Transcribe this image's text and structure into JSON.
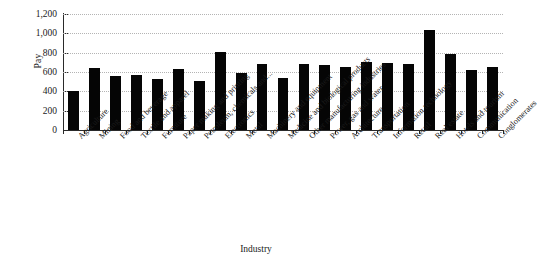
{
  "chart_data": {
    "type": "bar",
    "title": "",
    "xlabel": "Industry",
    "ylabel": "Pay",
    "ylim": [
      0,
      1200
    ],
    "ytick_step": 200,
    "ytick_labels": [
      "1,200",
      "1,000",
      "800",
      "600",
      "400",
      "200",
      "0"
    ],
    "ytick_values": [
      1200,
      1000,
      800,
      600,
      400,
      200,
      0
    ],
    "grid": "horizontal-dotted",
    "legend": "none",
    "bar_color": "#050505",
    "categories": [
      "Agriculture",
      "Mining",
      "Food and beverage",
      "Textile and apparel",
      "Furniture",
      "Paper making and printing",
      "Petroleum, chemicals and...",
      "Electronics",
      "Metal",
      "Machinery and equipment",
      "Medicine and biological products",
      "Other manufacturing industries",
      "Power, gas and water",
      "Architecture",
      "Transportation",
      "Information technology",
      "Retail",
      "Real estate",
      "Hotels and tourism",
      "Communication",
      "Conglomerates"
    ],
    "values": [
      400,
      645,
      555,
      565,
      530,
      630,
      505,
      805,
      585,
      680,
      540,
      680,
      675,
      650,
      705,
      695,
      680,
      1030,
      785,
      620,
      650
    ]
  }
}
